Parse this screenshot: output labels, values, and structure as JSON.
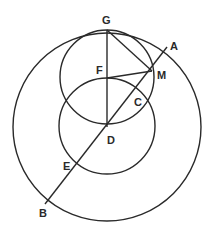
{
  "diagram": {
    "type": "geometry-construction",
    "circles": [
      {
        "id": "outer",
        "cx": 107,
        "cy": 127,
        "r": 94
      },
      {
        "id": "upper",
        "cx": 107,
        "cy": 77,
        "r": 47
      },
      {
        "id": "lower",
        "cx": 107,
        "cy": 126,
        "r": 48
      }
    ],
    "points": {
      "G": {
        "x": 107,
        "y": 30,
        "label": "G"
      },
      "A": {
        "x": 167,
        "y": 47,
        "label": "A"
      },
      "M": {
        "x": 152,
        "y": 71,
        "label": "M"
      },
      "F": {
        "x": 107,
        "y": 78,
        "label": "F"
      },
      "C": {
        "x": 136,
        "y": 91,
        "label": "C"
      },
      "D": {
        "x": 107,
        "y": 127,
        "label": "D"
      },
      "E": {
        "x": 76,
        "y": 165,
        "label": "E"
      },
      "B": {
        "x": 45,
        "y": 204,
        "label": "B"
      }
    },
    "segments": [
      {
        "from": "G",
        "to": "D"
      },
      {
        "from": "G",
        "to": "M"
      },
      {
        "from": "F",
        "to": "M"
      },
      {
        "from": "A",
        "to": "B"
      }
    ],
    "labels": {
      "G": "G",
      "A": "A",
      "M": "M",
      "F": "F",
      "C": "C",
      "D": "D",
      "E": "E",
      "B": "B"
    }
  }
}
